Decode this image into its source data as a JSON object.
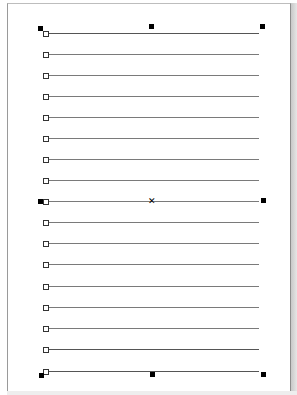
{
  "document": {
    "page": {
      "background": "#ffffff",
      "border_color": "#9a9a9a"
    },
    "ruled_lines": {
      "count": 17,
      "color": "#7a7a7a",
      "x_start": 46,
      "x_end": 259,
      "y_positions": [
        33,
        54,
        75,
        96,
        117,
        138,
        159,
        180,
        201,
        222,
        243,
        264,
        286,
        307,
        328,
        349,
        371
      ]
    },
    "selection": {
      "handle_color": "#000000",
      "handles": [
        {
          "id": "top-left",
          "x": 38,
          "y": 26
        },
        {
          "id": "top-center",
          "x": 149,
          "y": 24
        },
        {
          "id": "top-right",
          "x": 260,
          "y": 24
        },
        {
          "id": "middle-left",
          "x": 38,
          "y": 199
        },
        {
          "id": "middle-right",
          "x": 261,
          "y": 198
        },
        {
          "id": "bottom-left",
          "x": 39,
          "y": 373
        },
        {
          "id": "bottom-center",
          "x": 150,
          "y": 372
        },
        {
          "id": "bottom-right",
          "x": 261,
          "y": 372
        }
      ],
      "center_marker": {
        "glyph": "✕",
        "x": 148,
        "y": 198
      }
    }
  }
}
